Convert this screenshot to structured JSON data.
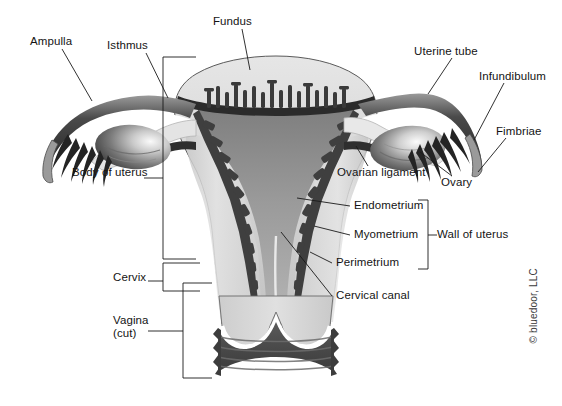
{
  "figure": {
    "copyright": "© bluedoor, LLC",
    "background_color": "#ffffff",
    "line_color": "#1a1a1a",
    "palette": {
      "perimetrium_outline": "#2b2b2b",
      "myometrium_light": "#d9d9d9",
      "myometrium_mid": "#b9b9b9",
      "endometrium_dark": "#4a4a4a",
      "cavity_gray": "#8c8c8c",
      "tube_dark": "#2e2e2e",
      "ovary_gradient_light": "#f2f2f2",
      "ovary_gradient_dark": "#4f4f4f",
      "vagina_dark": "#4a4a4a",
      "white_lumen": "#ffffff"
    },
    "labels": [
      {
        "id": "ampulla",
        "text": "Ampulla",
        "x": 30,
        "y": 42
      },
      {
        "id": "isthmus",
        "text": "Isthmus",
        "x": 107,
        "y": 46
      },
      {
        "id": "fundus",
        "text": "Fundus",
        "x": 213,
        "y": 21
      },
      {
        "id": "uterine-tube",
        "text": "Uterine tube",
        "x": 414,
        "y": 52
      },
      {
        "id": "infundibulum",
        "text": "Infundibulum",
        "x": 479,
        "y": 76
      },
      {
        "id": "fimbriae",
        "text": "Fimbriae",
        "x": 496,
        "y": 131
      },
      {
        "id": "ovarian-ligament",
        "text": "Ovarian ligament",
        "x": 337,
        "y": 172
      },
      {
        "id": "ovary",
        "text": "Ovary",
        "x": 441,
        "y": 182
      },
      {
        "id": "body-of-uterus",
        "text": "Body of uterus",
        "x": 72,
        "y": 172
      },
      {
        "id": "endometrium",
        "text": "Endometrium",
        "x": 354,
        "y": 205
      },
      {
        "id": "myometrium",
        "text": "Myometrium",
        "x": 354,
        "y": 234
      },
      {
        "id": "perimetrium",
        "text": "Perimetrium",
        "x": 336,
        "y": 262
      },
      {
        "id": "wall-of-uterus",
        "text": "Wall of uterus",
        "x": 437,
        "y": 234
      },
      {
        "id": "cervical-canal",
        "text": "Cervical canal",
        "x": 336,
        "y": 295
      },
      {
        "id": "cervix",
        "text": "Cervix",
        "x": 113,
        "y": 277
      },
      {
        "id": "vagina",
        "text": "Vagina",
        "x": 113,
        "y": 320
      },
      {
        "id": "vagina-cut",
        "text": "(cut)",
        "x": 113,
        "y": 333
      }
    ],
    "brackets": [
      {
        "id": "body-of-uterus-bracket",
        "side": "left",
        "x": 163,
        "top": 57,
        "bottom": 259
      },
      {
        "id": "cervix-bracket",
        "side": "left",
        "x": 163,
        "top": 263,
        "bottom": 291
      },
      {
        "id": "vagina-bracket",
        "side": "left",
        "x": 183,
        "top": 283,
        "bottom": 378
      },
      {
        "id": "wall-of-uterus-bracket",
        "side": "right",
        "x": 428,
        "top": 200,
        "bottom": 269
      }
    ]
  }
}
